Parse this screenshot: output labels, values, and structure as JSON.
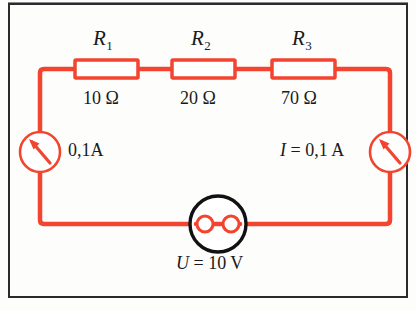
{
  "diagram": {
    "colors": {
      "wire": "#f2442e",
      "wire_light": "#f4674f",
      "socket": "#111111",
      "text": "#1a1a1a",
      "frame": "#2b2b2d",
      "background": "#fdfdfc"
    },
    "resistors": [
      {
        "name": "R",
        "subscript": "1",
        "value": "10 Ω"
      },
      {
        "name": "R",
        "subscript": "2",
        "value": "20 Ω"
      },
      {
        "name": "R",
        "subscript": "3",
        "value": "70 Ω"
      }
    ],
    "ammeters": [
      {
        "id": "left",
        "label": "0,1A",
        "symbol": "ammeter-needle"
      },
      {
        "id": "right",
        "label_italic": "I",
        "label_rest": " = 0,1 A",
        "symbol": "ammeter-needle"
      }
    ],
    "source": {
      "symbol": "wall-socket",
      "label_italic": "U",
      "label_rest": " = 10 V"
    }
  }
}
